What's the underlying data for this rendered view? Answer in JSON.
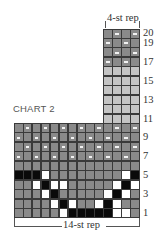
{
  "chart": {
    "title": "CHART 2",
    "top_rep_label": "4-st rep",
    "bottom_rep_label": "14-st rep",
    "colors": {
      "dark_gray": "#8a8a8a",
      "light_gray": "#c4c4c4",
      "black": "#0a0a0a",
      "white": "#ffffff",
      "grid_line": "#3a3a3a"
    },
    "legend_note": "cell codes: g=dark gray, l=light gray, b=black, w=white, d=dark gray with purl dash",
    "row_labels": [
      "1",
      "3",
      "5",
      "7",
      "9",
      "11",
      "13",
      "15",
      "17",
      "19",
      "20"
    ],
    "main_block": {
      "columns": 14,
      "rows": {
        "1": [
          "g",
          "g",
          "g",
          "g",
          "g",
          "w",
          "b",
          "b",
          "b",
          "b",
          "b",
          "w",
          "w",
          "g"
        ],
        "2": [
          "g",
          "g",
          "g",
          "g",
          "w",
          "b",
          "w",
          "g",
          "g",
          "w",
          "b",
          "w",
          "g",
          "g"
        ],
        "3": [
          "g",
          "g",
          "g",
          "w",
          "b",
          "g",
          "g",
          "g",
          "g",
          "g",
          "w",
          "b",
          "w",
          "g"
        ],
        "4": [
          "g",
          "g",
          "w",
          "b",
          "w",
          "w",
          "g",
          "g",
          "g",
          "g",
          "g",
          "w",
          "b",
          "w"
        ],
        "5": [
          "b",
          "b",
          "b",
          "w",
          "g",
          "g",
          "g",
          "g",
          "g",
          "g",
          "g",
          "g",
          "w",
          "b"
        ],
        "6": [
          "g",
          "g",
          "g",
          "g",
          "g",
          "g",
          "g",
          "g",
          "g",
          "g",
          "g",
          "g",
          "g",
          "g"
        ],
        "7": [
          "d",
          "g",
          "d",
          "g",
          "d",
          "g",
          "d",
          "g",
          "d",
          "g",
          "d",
          "g",
          "d",
          "g"
        ],
        "8": [
          "g",
          "d",
          "g",
          "d",
          "g",
          "d",
          "g",
          "d",
          "g",
          "d",
          "g",
          "d",
          "g",
          "d"
        ],
        "9": [
          "d",
          "g",
          "d",
          "g",
          "d",
          "g",
          "d",
          "g",
          "d",
          "g",
          "d",
          "g",
          "d",
          "g"
        ],
        "10": [
          "g",
          "d",
          "g",
          "d",
          "g",
          "d",
          "g",
          "d",
          "g",
          "d",
          "g",
          "d",
          "g",
          "d"
        ]
      }
    },
    "upper_block": {
      "columns": 4,
      "start_column": 10,
      "rows": {
        "11": [
          "l",
          "l",
          "l",
          "l"
        ],
        "12": [
          "l",
          "l",
          "l",
          "l"
        ],
        "13": [
          "l",
          "l",
          "l",
          "l"
        ],
        "14": [
          "l",
          "l",
          "l",
          "l"
        ],
        "15": [
          "l",
          "l",
          "l",
          "l"
        ],
        "16": [
          "l",
          "l",
          "l",
          "l"
        ],
        "17": [
          "d",
          "g",
          "d",
          "g"
        ],
        "18": [
          "g",
          "d",
          "g",
          "d"
        ],
        "19": [
          "d",
          "g",
          "d",
          "g"
        ],
        "20": [
          "g",
          "d",
          "g",
          "d"
        ]
      }
    }
  }
}
